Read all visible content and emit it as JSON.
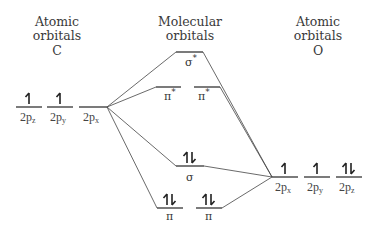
{
  "headers": {
    "left": {
      "line1": "Atomic",
      "line2": "orbitals",
      "line3": "C"
    },
    "center": {
      "line1": "Molecular",
      "line2": "orbitals"
    },
    "right": {
      "line1": "Atomic",
      "line2": "orbitals",
      "line3": "O"
    }
  },
  "carbon_orbitals": [
    {
      "label": "2p",
      "sub": "z",
      "electrons": "up"
    },
    {
      "label": "2p",
      "sub": "y",
      "electrons": "up"
    },
    {
      "label": "2p",
      "sub": "x",
      "electrons": "none"
    }
  ],
  "oxygen_orbitals": [
    {
      "label": "2p",
      "sub": "x",
      "electrons": "up"
    },
    {
      "label": "2p",
      "sub": "y",
      "electrons": "up"
    },
    {
      "label": "2p",
      "sub": "z",
      "electrons": "pair"
    }
  ],
  "molecular_orbitals": {
    "sigma_star": {
      "symbol": "σ",
      "sup": "*",
      "electrons": "none"
    },
    "pi_star_1": {
      "symbol": "π",
      "sup": "*",
      "electrons": "none"
    },
    "pi_star_2": {
      "symbol": "π",
      "sup": "*",
      "electrons": "none"
    },
    "sigma": {
      "symbol": "σ",
      "electrons": "pair"
    },
    "pi_1": {
      "symbol": "π",
      "electrons": "pair"
    },
    "pi_2": {
      "symbol": "π",
      "electrons": "pair"
    }
  }
}
